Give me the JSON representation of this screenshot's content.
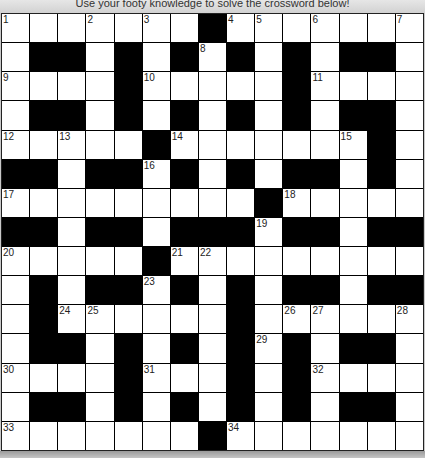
{
  "header": {
    "instruction": "Use your footy knowledge to solve the crossword below!"
  },
  "colors": {
    "filled": "#000000",
    "empty": "#ffffff",
    "header_bg": "#d8d8d8"
  },
  "grid": {
    "rows": 15,
    "cols": 15,
    "layout": [
      "...............",
      "..##.#.#.#.#..."
    ],
    "pattern": [
      ".......#.......",
      ".##.#.#.#.#.##.",
      "....#.....#....",
      ".##.#.#.#.#.##.",
      ".....#.......#.",
      "##.##.#.#.##.#.",
      ".........#.....",
      "##.##.###.##.##",
      ".....#.........",
      ".#.##.#.#.##.##",
      ".#......#......",
      ".##.#.#.#.#.##.",
      "....#...#.#....",
      ".##.#.#.#.#.##.",
      ".......#......."
    ],
    "numbers": [
      {
        "n": 1,
        "r": 0,
        "c": 0
      },
      {
        "n": 2,
        "r": 0,
        "c": 3
      },
      {
        "n": 3,
        "r": 0,
        "c": 5
      },
      {
        "n": 4,
        "r": 0,
        "c": 8
      },
      {
        "n": 5,
        "r": 0,
        "c": 9
      },
      {
        "n": 6,
        "r": 0,
        "c": 11
      },
      {
        "n": 7,
        "r": 0,
        "c": 14
      },
      {
        "n": 8,
        "r": 1,
        "c": 7
      },
      {
        "n": 9,
        "r": 2,
        "c": 0
      },
      {
        "n": 10,
        "r": 2,
        "c": 5
      },
      {
        "n": 11,
        "r": 2,
        "c": 11
      },
      {
        "n": 12,
        "r": 4,
        "c": 0
      },
      {
        "n": 13,
        "r": 4,
        "c": 2
      },
      {
        "n": 14,
        "r": 4,
        "c": 6
      },
      {
        "n": 15,
        "r": 4,
        "c": 12
      },
      {
        "n": 16,
        "r": 5,
        "c": 5
      },
      {
        "n": 17,
        "r": 6,
        "c": 0
      },
      {
        "n": 18,
        "r": 6,
        "c": 10
      },
      {
        "n": 19,
        "r": 7,
        "c": 9
      },
      {
        "n": 20,
        "r": 8,
        "c": 0
      },
      {
        "n": 21,
        "r": 8,
        "c": 6
      },
      {
        "n": 22,
        "r": 8,
        "c": 7
      },
      {
        "n": 23,
        "r": 9,
        "c": 5
      },
      {
        "n": 24,
        "r": 10,
        "c": 2
      },
      {
        "n": 25,
        "r": 10,
        "c": 3
      },
      {
        "n": 26,
        "r": 10,
        "c": 10
      },
      {
        "n": 27,
        "r": 10,
        "c": 11
      },
      {
        "n": 28,
        "r": 10,
        "c": 14
      },
      {
        "n": 29,
        "r": 11,
        "c": 9
      },
      {
        "n": 30,
        "r": 12,
        "c": 0
      },
      {
        "n": 31,
        "r": 12,
        "c": 5
      },
      {
        "n": 32,
        "r": 12,
        "c": 11
      },
      {
        "n": 33,
        "r": 14,
        "c": 0
      },
      {
        "n": 34,
        "r": 14,
        "c": 8
      }
    ]
  }
}
